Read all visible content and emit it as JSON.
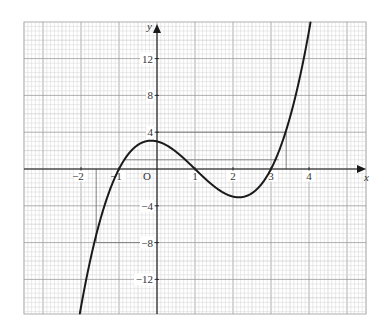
{
  "chart_data": {
    "type": "line",
    "title": "",
    "xlabel": "x",
    "ylabel": "y",
    "origin_label": "O",
    "function": "y = x^3 - 3x^2 - x + 3",
    "coefficients": [
      1,
      -3,
      -1,
      3
    ],
    "xlim": [
      -3.5,
      5.5
    ],
    "ylim": [
      -15.75,
      16
    ],
    "grid": true,
    "x_ticks": [
      {
        "value": -2,
        "label": "−2"
      },
      {
        "value": -1,
        "label": "−1"
      },
      {
        "value": 1,
        "label": "1"
      },
      {
        "value": 2,
        "label": "2"
      },
      {
        "value": 3,
        "label": "3"
      },
      {
        "value": 4,
        "label": "4"
      }
    ],
    "y_ticks": [
      {
        "value": 12,
        "label": "12"
      },
      {
        "value": 8,
        "label": "8"
      },
      {
        "value": 4,
        "label": "4"
      },
      {
        "value": -4,
        "label": "−4"
      },
      {
        "value": -8,
        "label": "−8"
      },
      {
        "value": -12,
        "label": "−12"
      }
    ],
    "series": [
      {
        "name": "cubic curve",
        "x": [
          -2,
          -1.5,
          -1,
          -0.5,
          -0.155,
          0,
          0.5,
          1,
          1.5,
          2,
          2.155,
          2.5,
          3,
          3.5,
          4
        ],
        "y": [
          -15,
          -5.625,
          0,
          2.625,
          3.08,
          3,
          1.875,
          0,
          -1.875,
          -3,
          -3.08,
          -2.625,
          0,
          5.625,
          15
        ]
      }
    ],
    "key_points": {
      "roots": [
        -1,
        1,
        3
      ],
      "local_max": [
        -0.15,
        3.08
      ],
      "local_min": [
        2.15,
        -3.08
      ],
      "y_intercept": 3
    },
    "reference_lines": [
      {
        "name": "y=4 guide",
        "x1": 0,
        "y1": 4,
        "x2": 3.4,
        "y2": 4
      },
      {
        "name": "x=3.4 guide",
        "x1": 3.4,
        "y1": 4,
        "x2": 3.4,
        "y2": 0
      },
      {
        "name": "y=1 guide",
        "x1": -0.85,
        "y1": 1,
        "x2": 3.2,
        "y2": 1
      },
      {
        "name": "x=-1.6 guide",
        "x1": -1.6,
        "y1": 0,
        "x2": -1.6,
        "y2": -8
      },
      {
        "name": "y=-8 guide",
        "x1": -1.6,
        "y1": -8,
        "x2": 0,
        "y2": -8
      }
    ],
    "colors": {
      "curve": "#1a1a1a",
      "axis": "#1a1a1a",
      "grid_minor": "#d4d4d4",
      "grid_mid": "#b8b8b8",
      "grid_major": "#9a9a9a",
      "guide": "#7a7a7a"
    }
  }
}
